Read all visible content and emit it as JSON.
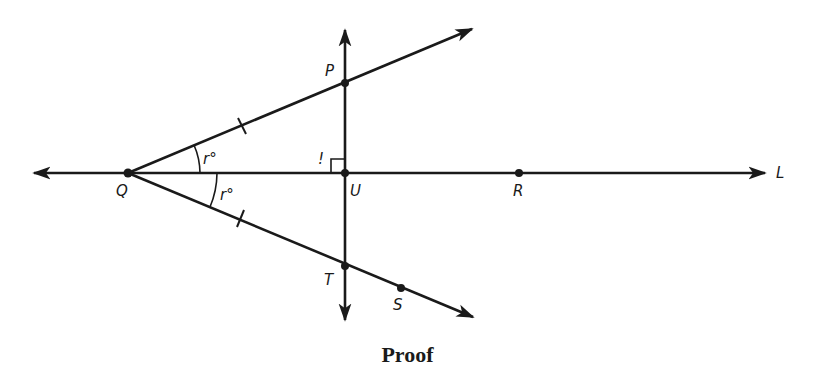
{
  "figure": {
    "caption": "Proof",
    "colors": {
      "ink": "#1a1a1a",
      "background": "#ffffff"
    },
    "points": {
      "Q": {
        "label": "Q",
        "x": 128,
        "y": 173
      },
      "P": {
        "label": "P",
        "x": 345,
        "y": 83
      },
      "U": {
        "label": "U",
        "x": 345,
        "y": 173
      },
      "T": {
        "label": "T",
        "x": 345,
        "y": 266
      },
      "R": {
        "label": "R",
        "x": 519,
        "y": 173
      },
      "S": {
        "label": "S",
        "x": 401,
        "y": 288
      }
    },
    "lines": {
      "L": {
        "label": "L",
        "description": "horizontal line through Q, U, R"
      },
      "vertical": {
        "description": "vertical line through P, U, T perpendicular to L"
      },
      "ray_QP": {
        "description": "ray from Q through P"
      },
      "ray_QS": {
        "description": "ray from Q through T and S"
      }
    },
    "angles": {
      "upper": {
        "label": "r°"
      },
      "lower": {
        "label": "r°"
      }
    },
    "right_angle_mark": {
      "label": "!"
    }
  }
}
